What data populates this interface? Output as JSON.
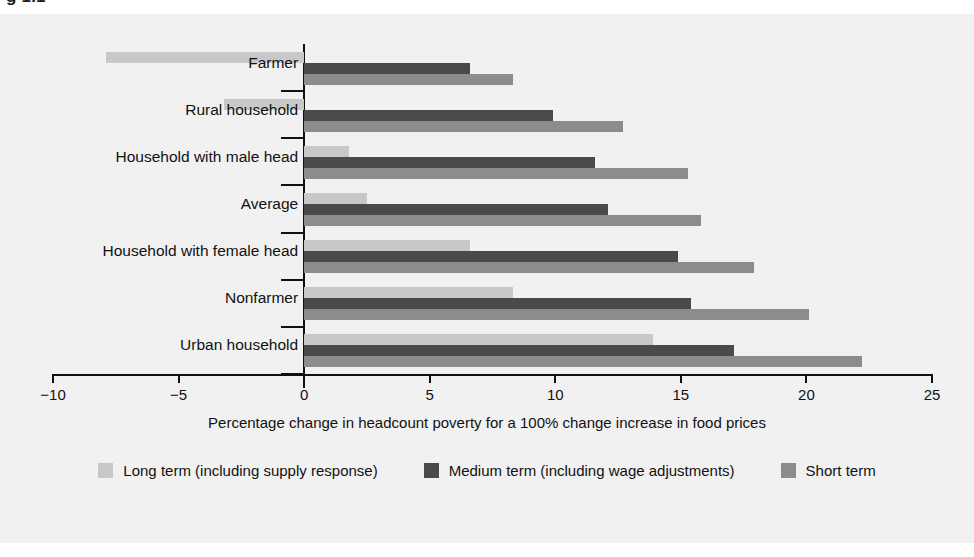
{
  "figure": {
    "title_partial": "g 1.1",
    "background_color": "#f1f1f1"
  },
  "colors": {
    "long_term": "#c8c8c8",
    "medium_term": "#4a4a4a",
    "short_term": "#8c8c8c",
    "axis": "#111111",
    "text": "#111111"
  },
  "axis": {
    "title": "Percentage change in headcount poverty for a 100% change increase in food prices",
    "ticks": [
      "−10",
      "−5",
      "0",
      "5",
      "10",
      "15",
      "20",
      "25"
    ],
    "tick_values": [
      -10,
      -5,
      0,
      5,
      10,
      15,
      20,
      25
    ]
  },
  "legend": {
    "items": [
      {
        "label": "Long term (including supply response)",
        "color_key": "long_term",
        "swatch": "#c8c8c8"
      },
      {
        "label": "Medium term (including wage adjustments)",
        "color_key": "medium_term",
        "swatch": "#4a4a4a"
      },
      {
        "label": "Short term",
        "color_key": "short_term",
        "swatch": "#8c8c8c"
      }
    ]
  },
  "chart_data": {
    "type": "bar",
    "orientation": "horizontal",
    "title": "",
    "xlabel": "Percentage change in headcount poverty for a 100% change increase in food prices",
    "ylabel": "",
    "xlim": [
      -10,
      25
    ],
    "xticks": [
      -10,
      -5,
      0,
      5,
      10,
      15,
      20,
      25
    ],
    "grid": false,
    "legend_position": "bottom",
    "categories": [
      "Farmer",
      "Rural household",
      "Household with male head",
      "Average",
      "Household with female head",
      "Nonfarmer",
      "Urban household"
    ],
    "series": [
      {
        "name": "Long term (including supply response)",
        "color": "#c8c8c8",
        "values": [
          -7.9,
          -3.2,
          1.8,
          2.5,
          6.6,
          8.3,
          13.9
        ]
      },
      {
        "name": "Medium term (including wage adjustments)",
        "color": "#4a4a4a",
        "values": [
          6.6,
          9.9,
          11.6,
          12.1,
          14.9,
          15.4,
          17.1
        ]
      },
      {
        "name": "Short term",
        "color": "#8c8c8c",
        "values": [
          8.3,
          12.7,
          15.3,
          15.8,
          17.9,
          20.1,
          22.2
        ]
      }
    ]
  }
}
